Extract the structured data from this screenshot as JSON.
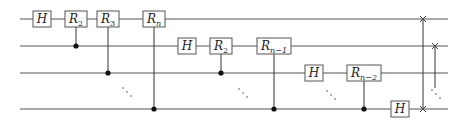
{
  "diagram": {
    "wires": [
      {
        "y": 19,
        "x1": 20,
        "x2": 448
      },
      {
        "y": 46,
        "x1": 20,
        "x2": 448
      },
      {
        "y": 73,
        "x1": 20,
        "x2": 448
      },
      {
        "y": 109,
        "x1": 20,
        "x2": 448
      }
    ],
    "gates": [
      {
        "label": "H",
        "sub": "",
        "x": 42,
        "wire": 0,
        "w": 18
      },
      {
        "label": "R",
        "sub": "2",
        "x": 76,
        "wire": 0,
        "w": 22,
        "control_wire": 1
      },
      {
        "label": "R",
        "sub": "3",
        "x": 108,
        "wire": 0,
        "w": 22,
        "control_wire": 2
      },
      {
        "label": "R",
        "sub": "n",
        "x": 154,
        "wire": 0,
        "w": 22,
        "control_wire": 3
      },
      {
        "label": "H",
        "sub": "",
        "x": 187,
        "wire": 1,
        "w": 18
      },
      {
        "label": "R",
        "sub": "2",
        "x": 221,
        "wire": 1,
        "w": 22,
        "control_wire": 2
      },
      {
        "label": "R",
        "sub": "n−1",
        "x": 274,
        "wire": 1,
        "w": 34,
        "control_wire": 3
      },
      {
        "label": "H",
        "sub": "",
        "x": 314,
        "wire": 2,
        "w": 18
      },
      {
        "label": "R",
        "sub": "n−2",
        "x": 364,
        "wire": 2,
        "w": 34,
        "control_wire": 3
      },
      {
        "label": "H",
        "sub": "",
        "x": 400,
        "wire": 3,
        "w": 18
      }
    ],
    "ellipses": [
      {
        "x": 127,
        "y": 92
      },
      {
        "x": 243,
        "y": 93
      },
      {
        "x": 331,
        "y": 95
      },
      {
        "x": 436,
        "y": 94
      }
    ],
    "swaps": [
      {
        "x": 423,
        "from_wire": 0,
        "to_wire": 3,
        "style": "solid"
      },
      {
        "x": 435,
        "from_wire": 1,
        "to_wire": "dots",
        "style": "dotted"
      }
    ]
  }
}
